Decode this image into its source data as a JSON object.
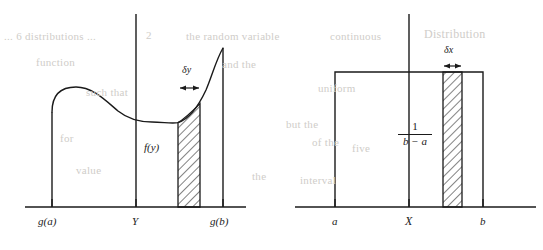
{
  "figure": {
    "type": "diagram",
    "background_color": "#ffffff",
    "ink_color": "#1a1a1a",
    "ghost_text_color": "#cfcdc9",
    "panels": [
      {
        "id": "left-panel",
        "axis": {
          "x_start": 25,
          "x_end": 246,
          "y": 207
        },
        "vertical_axis": {
          "x": 136,
          "y_top": 14,
          "y_bottom": 207
        },
        "x_ticks": [
          {
            "label": "g(a)",
            "x": 52,
            "label_y": 222
          },
          {
            "label": "Y",
            "x": 136,
            "label_y": 222
          },
          {
            "label": "g(b)",
            "x": 223,
            "label_y": 222
          }
        ],
        "curve_label": {
          "text": "f(y)",
          "x": 146,
          "y": 148
        },
        "strip": {
          "x_left": 178,
          "x_right": 200,
          "label": "δy",
          "label_x": 183,
          "label_y": 68,
          "arrow_y": 88,
          "hatch_angle_deg": 45
        },
        "curve": {
          "left_wall_x": 52,
          "left_wall_top_y": 112,
          "right_wall_x": 223,
          "right_wall_top_y": 48,
          "local_max_y": 88,
          "local_max_x": 82,
          "local_min_y": 118,
          "local_min_x": 160
        }
      },
      {
        "id": "right-panel",
        "axis": {
          "x_start": 295,
          "x_end": 536,
          "y": 207
        },
        "vertical_axis": {
          "x": 409,
          "y_top": 14,
          "y_bottom": 207
        },
        "x_ticks": [
          {
            "label": "a",
            "x": 335,
            "label_y": 222
          },
          {
            "label": "X",
            "x": 409,
            "label_y": 222
          },
          {
            "label": "b",
            "x": 483,
            "label_y": 222
          }
        ],
        "rectangle": {
          "x_left": 335,
          "x_right": 483,
          "top_y": 72
        },
        "height_label": {
          "numerator": "1",
          "denominator": "b − a",
          "x": 409,
          "y": 130
        },
        "strip": {
          "x_left": 443,
          "x_right": 462,
          "label": "δx",
          "label_x": 444,
          "label_y": 48,
          "arrow_y": 66,
          "hatch_angle_deg": 45
        }
      }
    ],
    "ghost_text": [
      {
        "text": "... 6 distributions ...",
        "x": 4,
        "y": 36
      },
      {
        "text": "2",
        "x": 146,
        "y": 35
      },
      {
        "text": "the random variable",
        "x": 186,
        "y": 36
      },
      {
        "text": "continuous",
        "x": 330,
        "y": 36
      },
      {
        "text": "Distribution",
        "x": 424,
        "y": 33
      },
      {
        "text": "function",
        "x": 36,
        "y": 62
      },
      {
        "text": "and the",
        "x": 222,
        "y": 64
      },
      {
        "text": "such that",
        "x": 86,
        "y": 92
      },
      {
        "text": "uniform",
        "x": 318,
        "y": 88
      },
      {
        "text": "but the",
        "x": 286,
        "y": 124
      },
      {
        "text": "for",
        "x": 60,
        "y": 138
      },
      {
        "text": "of the",
        "x": 312,
        "y": 142
      },
      {
        "text": "five",
        "x": 352,
        "y": 148
      },
      {
        "text": "value",
        "x": 76,
        "y": 170
      },
      {
        "text": "the",
        "x": 252,
        "y": 176
      },
      {
        "text": "interval",
        "x": 300,
        "y": 180
      }
    ]
  }
}
